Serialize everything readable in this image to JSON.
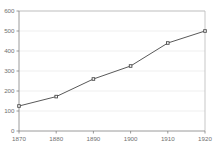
{
  "chart_data": {
    "type": "line",
    "title": "",
    "subtitle": "",
    "xlabel": "",
    "ylabel": "",
    "categories": [
      "1870",
      "1880",
      "1890",
      "1900",
      "1910",
      "1920"
    ],
    "x": [
      1870,
      1880,
      1890,
      1900,
      1910,
      1920
    ],
    "values": [
      125,
      172,
      260,
      325,
      440,
      500
    ],
    "series": [
      {
        "name": "",
        "values": [
          125,
          172,
          260,
          325,
          440,
          500
        ]
      }
    ],
    "xlim": [
      1870,
      1920
    ],
    "ylim": [
      0,
      600
    ],
    "ytick_labels": [
      "0",
      "100",
      "200",
      "300",
      "400",
      "500",
      "600"
    ],
    "ytick_values": [
      0,
      100,
      200,
      300,
      400,
      500,
      600
    ],
    "xtick_labels": [
      "1870",
      "1880",
      "1890",
      "1900",
      "1910",
      "1920"
    ],
    "xtick_values": [
      1870,
      1880,
      1890,
      1900,
      1910,
      1920
    ],
    "grid": "horizontal",
    "legend": "none",
    "marker": "square-open",
    "line_color": "#595959",
    "marker_face_color": "#ffffff",
    "marker_edge_color": "#4a4a4a",
    "grid_color": "#e8e8e8",
    "axis_color": "#808080",
    "tick_label_color": "#6f6f6f",
    "background_color": "#ffffff",
    "annotations": []
  }
}
